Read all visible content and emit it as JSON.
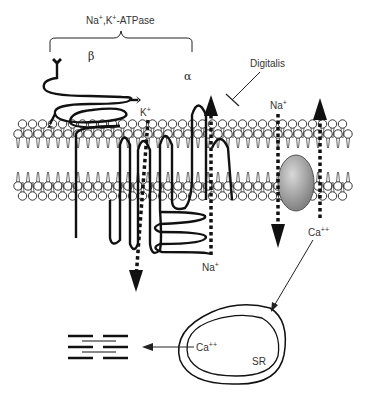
{
  "title": "Na+,K+-ATPase",
  "title_parts": {
    "na": "Na",
    "na_sup": "+",
    "sep": ",K",
    "k_sup": "+",
    "rest": "-ATPase"
  },
  "subunits": {
    "beta": "β",
    "alpha": "α"
  },
  "inhibitor": "Digitalis",
  "ions": {
    "k_in": {
      "base": "K",
      "sup": "+"
    },
    "na_out": {
      "base": "Na",
      "sup": "+"
    },
    "na_exch": {
      "base": "Na",
      "sup": "+"
    },
    "ca_exch": {
      "base": "Ca",
      "sup": "++"
    },
    "ca_sr": {
      "base": "Ca",
      "sup": "++"
    }
  },
  "organelle": "SR",
  "colors": {
    "line": "#111111",
    "exchanger_fill": "#8a8a8a",
    "background": "#ffffff"
  }
}
